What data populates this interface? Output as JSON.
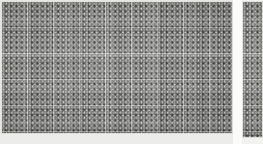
{
  "image": {
    "kind": "array-micrograph",
    "width_px": 263,
    "height_px": 144,
    "description": "Grayscale micrograph of a dense rectangular array of square cells, each with a dark central aperture, arranged on a regular lattice. A large main array occupies the left portion and a narrow secondary array strip sits at the right, separated by a bright vertical gap.",
    "background_color": "#f2f2f0"
  },
  "panels": [
    {
      "id": "main-array",
      "label": "Main cell array",
      "x": 1,
      "y": 1,
      "width": 232,
      "height": 133,
      "columns": 45,
      "rows": 26,
      "cell_pitch_px": 5.2,
      "subblock_period_px": 26,
      "cell_body_color": "#8a8a88",
      "cell_center_color": "#373737",
      "separator_color": "#d6d6d2",
      "seam_color": "#e8e8e4"
    },
    {
      "id": "side-array",
      "label": "Secondary array strip",
      "x": 242,
      "y": 1,
      "width": 21,
      "height": 137,
      "columns": 4,
      "rows": 27,
      "cell_pitch_px": 5.2,
      "subblock_period_px": 26,
      "cell_body_color": "#8a8a88",
      "cell_center_color": "#373737",
      "separator_color": "#d6d6d2",
      "seam_color": "#e8e8e4"
    }
  ],
  "separators": {
    "panel_gap": {
      "label": "Gap between main array and side strip",
      "x": 233,
      "y": 0,
      "width": 9,
      "height": 144,
      "color": "#fbfbf9"
    },
    "bottom_margin": {
      "label": "Lower margin below main array",
      "x": 0,
      "y": 134,
      "width": 233,
      "height": 10,
      "color": "#ececeb"
    },
    "top_hairline": {
      "label": "Top edge hairline",
      "color": "#e6e6e3"
    },
    "left_hairline": {
      "label": "Left edge hairline",
      "color": "#e6e6e3"
    }
  }
}
